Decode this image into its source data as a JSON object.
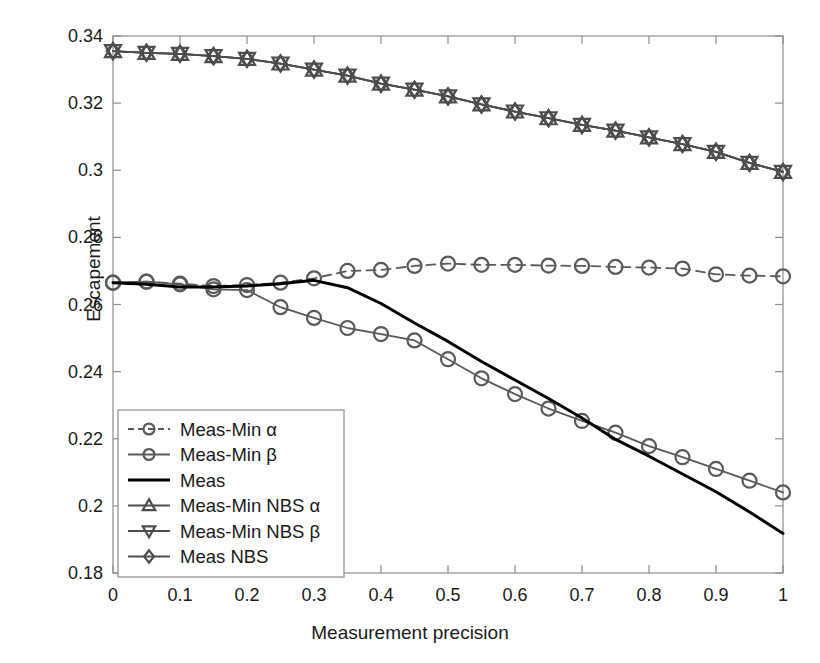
{
  "chart_data": {
    "type": "line",
    "title": "",
    "xlabel": "Measurement precision",
    "ylabel": "Escapement",
    "xlim": [
      0,
      1
    ],
    "ylim": [
      0.18,
      0.34
    ],
    "xticks": [
      "0",
      "0.1",
      "0.2",
      "0.3",
      "0.4",
      "0.5",
      "0.6",
      "0.7",
      "0.8",
      "0.9",
      "1"
    ],
    "xtick_values": [
      0,
      0.1,
      0.2,
      0.3,
      0.4,
      0.5,
      0.6,
      0.7,
      0.8,
      0.9,
      1
    ],
    "yticks": [
      "0.18",
      "0.2",
      "0.22",
      "0.24",
      "0.26",
      "0.28",
      "0.3",
      "0.32",
      "0.34"
    ],
    "ytick_values": [
      0.18,
      0.2,
      0.22,
      0.24,
      0.26,
      0.28,
      0.3,
      0.32,
      0.34
    ],
    "grid": false,
    "legend_position": "lower left",
    "x": [
      0,
      0.05,
      0.1,
      0.15,
      0.2,
      0.25,
      0.3,
      0.35,
      0.4,
      0.45,
      0.5,
      0.55,
      0.6,
      0.65,
      0.7,
      0.75,
      0.8,
      0.85,
      0.9,
      0.95,
      1
    ],
    "series": [
      {
        "name": "Meas-Min α",
        "marker": "circle",
        "linestyle": "dashed",
        "color": "#595959",
        "values": [
          0.2665,
          0.2668,
          0.2662,
          0.2655,
          0.2658,
          0.2665,
          0.2678,
          0.27,
          0.2703,
          0.2715,
          0.2722,
          0.2718,
          0.2718,
          0.2716,
          0.2715,
          0.2712,
          0.271,
          0.2707,
          0.269,
          0.2686,
          0.2684
        ]
      },
      {
        "name": "Meas-Min β",
        "marker": "circle",
        "linestyle": "solid",
        "color": "#595959",
        "values": [
          0.2665,
          0.2668,
          0.266,
          0.2645,
          0.2643,
          0.2592,
          0.256,
          0.253,
          0.2512,
          0.2493,
          0.2437,
          0.238,
          0.2333,
          0.229,
          0.2253,
          0.2218,
          0.2178,
          0.2145,
          0.211,
          0.2075,
          0.204
        ]
      },
      {
        "name": "Meas",
        "marker": "none",
        "linestyle": "solid",
        "color": "#000000",
        "values": [
          0.2665,
          0.266,
          0.2652,
          0.2652,
          0.2655,
          0.2662,
          0.2672,
          0.265,
          0.2603,
          0.2545,
          0.249,
          0.243,
          0.2375,
          0.232,
          0.2262,
          0.2198,
          0.2148,
          0.2095,
          0.2042,
          0.1982,
          0.1918
        ]
      },
      {
        "name": "Meas-Min NBS α",
        "marker": "triangle-up",
        "linestyle": "solid",
        "color": "#4d4d4d",
        "values": [
          0.3355,
          0.335,
          0.3347,
          0.334,
          0.3332,
          0.3318,
          0.33,
          0.3282,
          0.3258,
          0.324,
          0.322,
          0.3196,
          0.3175,
          0.3155,
          0.3135,
          0.3118,
          0.3098,
          0.3078,
          0.3055,
          0.3022,
          0.2995
        ]
      },
      {
        "name": "Meas-Min NBS β",
        "marker": "triangle-down",
        "linestyle": "solid",
        "color": "#4d4d4d",
        "values": [
          0.3355,
          0.335,
          0.3347,
          0.334,
          0.3332,
          0.3318,
          0.33,
          0.3282,
          0.3258,
          0.324,
          0.322,
          0.3196,
          0.3175,
          0.3155,
          0.3135,
          0.3118,
          0.3098,
          0.3078,
          0.3055,
          0.3022,
          0.2995
        ]
      },
      {
        "name": "Meas NBS",
        "marker": "diamond",
        "linestyle": "solid",
        "color": "#4d4d4d",
        "values": [
          0.3355,
          0.335,
          0.3347,
          0.334,
          0.3332,
          0.3318,
          0.33,
          0.3282,
          0.3258,
          0.324,
          0.322,
          0.3196,
          0.3175,
          0.3155,
          0.3135,
          0.3118,
          0.3098,
          0.3078,
          0.3055,
          0.3022,
          0.2995
        ]
      }
    ]
  },
  "axes": {
    "y_title": "Escapement",
    "x_title": "Measurement precision"
  },
  "legend": {
    "items": [
      {
        "label": "Meas-Min α"
      },
      {
        "label": "Meas-Min β"
      },
      {
        "label": "Meas"
      },
      {
        "label": "Meas-Min NBS α"
      },
      {
        "label": "Meas-Min NBS β"
      },
      {
        "label": "Meas NBS"
      }
    ]
  }
}
